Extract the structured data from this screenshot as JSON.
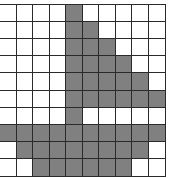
{
  "grid": {
    "rows": 10,
    "cols": 10,
    "colors": {
      "filled": "#808080",
      "empty": "#ffffff",
      "line": "#2a2a2a"
    },
    "cells": [
      [
        0,
        0,
        0,
        0,
        1,
        0,
        0,
        0,
        0,
        0
      ],
      [
        0,
        0,
        0,
        0,
        1,
        1,
        0,
        0,
        0,
        0
      ],
      [
        0,
        0,
        0,
        0,
        1,
        1,
        1,
        0,
        0,
        0
      ],
      [
        0,
        0,
        0,
        0,
        1,
        1,
        1,
        1,
        0,
        0
      ],
      [
        0,
        0,
        0,
        0,
        1,
        1,
        1,
        1,
        1,
        0
      ],
      [
        0,
        0,
        0,
        0,
        1,
        1,
        1,
        1,
        1,
        1
      ],
      [
        0,
        0,
        0,
        0,
        1,
        0,
        0,
        0,
        0,
        0
      ],
      [
        1,
        1,
        1,
        1,
        1,
        1,
        1,
        1,
        1,
        1
      ],
      [
        0,
        1,
        1,
        1,
        1,
        1,
        1,
        1,
        1,
        0
      ],
      [
        0,
        0,
        1,
        1,
        1,
        1,
        1,
        1,
        0,
        0
      ]
    ]
  }
}
